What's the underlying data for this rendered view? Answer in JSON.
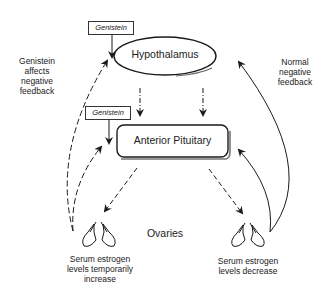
{
  "diagram": {
    "nodes": {
      "hypothalamus": "Hypothalamus",
      "anterior_pituitary": "Anterior Pituitary",
      "ovaries": "Ovaries"
    },
    "genistein_boxes": [
      {
        "label": "Genistein",
        "target": "Hypothalamus"
      },
      {
        "label": "Genistein",
        "target": "Anterior Pituitary"
      }
    ],
    "annotations": {
      "left_feedback": [
        "Genistein",
        "affects",
        "negative",
        "feedback"
      ],
      "right_feedback": [
        "Normal",
        "negative",
        "feedback"
      ],
      "left_ovary": [
        "Serum estrogen",
        "levels temporarily",
        "increase"
      ],
      "right_ovary": [
        "Serum estrogen",
        "levels decrease"
      ]
    },
    "edges": [
      {
        "from": "Hypothalamus",
        "to": "Anterior Pituitary",
        "style": "dash-dot"
      },
      {
        "from": "Hypothalamus",
        "to": "Anterior Pituitary",
        "style": "dash-dot"
      },
      {
        "from": "Anterior Pituitary",
        "to": "Ovaries (left)",
        "style": "dashed"
      },
      {
        "from": "Anterior Pituitary",
        "to": "Ovaries (right)",
        "style": "dashed"
      },
      {
        "from": "Ovaries (left)",
        "to": "Hypothalamus",
        "style": "dashed"
      },
      {
        "from": "Ovaries (left)",
        "to": "Anterior Pituitary",
        "style": "dashed"
      },
      {
        "from": "Ovaries (right)",
        "to": "Hypothalamus",
        "style": "solid"
      },
      {
        "from": "Ovaries (right)",
        "to": "Anterior Pituitary",
        "style": "solid"
      }
    ],
    "colors": {
      "stroke": "#1a1a1a",
      "background": "#ffffff"
    }
  }
}
